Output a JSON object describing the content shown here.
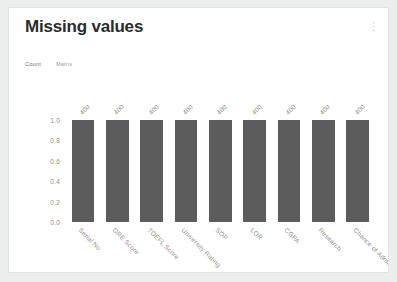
{
  "header": {
    "title": "Missing values",
    "action_icon": "more-options-icon"
  },
  "tabs": [
    {
      "label": "Count",
      "active": true
    },
    {
      "label": "Matrix",
      "active": false
    }
  ],
  "colors": {
    "bar": "#5c5c5c",
    "axis_text": "#8e9093",
    "card_background": "#ffffff",
    "page_background": "#eceded"
  },
  "chart_data": {
    "type": "bar",
    "title": "Missing values",
    "xlabel": "",
    "ylabel": "",
    "ylim": [
      0.0,
      1.0
    ],
    "yticks": [
      "1.0",
      "0.8",
      "0.6",
      "0.4",
      "0.2",
      "0.0"
    ],
    "ytick_values": [
      1.0,
      0.8,
      0.6,
      0.4,
      0.2,
      0.0
    ],
    "grid": false,
    "legend": "none",
    "categories": [
      "Serial No.",
      "GRE Score",
      "TOEFL Score",
      "University Rating",
      "SOP",
      "LOR",
      "CGPA",
      "Research",
      "Chance of Admit"
    ],
    "values": [
      1.0,
      1.0,
      1.0,
      1.0,
      1.0,
      1.0,
      1.0,
      1.0,
      1.0
    ],
    "data_labels": [
      "400",
      "400",
      "400",
      "400",
      "400",
      "400",
      "400",
      "400",
      "400"
    ]
  }
}
